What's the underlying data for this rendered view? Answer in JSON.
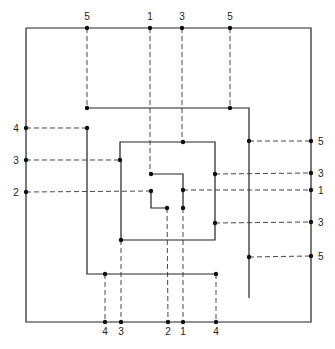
{
  "diagram": {
    "title": "",
    "colors": {
      "line": "#222222",
      "dashed": "#333333",
      "dot": "#111111",
      "background": "#ffffff"
    },
    "solid_paths": [
      {
        "name": "outer-boundary",
        "points": [
          [
            26,
            28
          ],
          [
            311,
            28
          ],
          [
            311,
            322
          ],
          [
            26,
            322
          ],
          [
            26,
            28
          ]
        ]
      },
      {
        "name": "spiral-level-2",
        "points": [
          [
            87,
            108
          ],
          [
            249,
            108
          ],
          [
            249,
            298
          ]
        ]
      },
      {
        "name": "spiral-level-2-left",
        "points": [
          [
            87,
            128
          ],
          [
            87,
            274
          ],
          [
            216,
            274
          ]
        ]
      },
      {
        "name": "spiral-level-3",
        "points": [
          [
            120,
            160
          ],
          [
            120,
            142
          ],
          [
            215,
            142
          ],
          [
            215,
            240
          ],
          [
            121,
            240
          ],
          [
            121,
            160
          ]
        ]
      },
      {
        "name": "spiral-inner-a",
        "points": [
          [
            151,
            174
          ],
          [
            183,
            174
          ],
          [
            183,
            208
          ]
        ]
      },
      {
        "name": "spiral-inner-b",
        "points": [
          [
            151,
            191
          ],
          [
            151,
            208
          ],
          [
            167,
            208
          ]
        ]
      }
    ],
    "dashed_lines": [
      {
        "from": [
          87,
          28
        ],
        "to": [
          87,
          108
        ]
      },
      {
        "from": [
          150,
          28
        ],
        "to": [
          150,
          174
        ]
      },
      {
        "from": [
          182,
          28
        ],
        "to": [
          182,
          142
        ]
      },
      {
        "from": [
          230,
          28
        ],
        "to": [
          230,
          108
        ]
      },
      {
        "from": [
          26,
          128
        ],
        "to": [
          87,
          128
        ]
      },
      {
        "from": [
          26,
          160
        ],
        "to": [
          120,
          160
        ]
      },
      {
        "from": [
          26,
          192
        ],
        "to": [
          151,
          191
        ]
      },
      {
        "from": [
          249,
          141
        ],
        "to": [
          311,
          141
        ]
      },
      {
        "from": [
          215,
          174
        ],
        "to": [
          311,
          173
        ]
      },
      {
        "from": [
          183,
          190
        ],
        "to": [
          311,
          190
        ]
      },
      {
        "from": [
          215,
          223
        ],
        "to": [
          311,
          222
        ]
      },
      {
        "from": [
          249,
          257
        ],
        "to": [
          311,
          256
        ]
      },
      {
        "from": [
          105,
          274
        ],
        "to": [
          105,
          322
        ]
      },
      {
        "from": [
          121,
          240
        ],
        "to": [
          121,
          322
        ]
      },
      {
        "from": [
          167,
          208
        ],
        "to": [
          168,
          322
        ]
      },
      {
        "from": [
          183,
          208
        ],
        "to": [
          183,
          322
        ]
      },
      {
        "from": [
          216,
          274
        ],
        "to": [
          216,
          322
        ]
      }
    ],
    "dots": [
      [
        87,
        28
      ],
      [
        150,
        28
      ],
      [
        182,
        28
      ],
      [
        230,
        28
      ],
      [
        87,
        108
      ],
      [
        230,
        108
      ],
      [
        26,
        128
      ],
      [
        26,
        160
      ],
      [
        26,
        192
      ],
      [
        87,
        128
      ],
      [
        120,
        160
      ],
      [
        311,
        141
      ],
      [
        311,
        173
      ],
      [
        311,
        190
      ],
      [
        311,
        222
      ],
      [
        311,
        256
      ],
      [
        249,
        141
      ],
      [
        215,
        174
      ],
      [
        183,
        190
      ],
      [
        215,
        223
      ],
      [
        249,
        257
      ],
      [
        183,
        142
      ],
      [
        151,
        174
      ],
      [
        151,
        191
      ],
      [
        167,
        208
      ],
      [
        183,
        208
      ],
      [
        121,
        240
      ],
      [
        105,
        274
      ],
      [
        216,
        274
      ],
      [
        105,
        322
      ],
      [
        121,
        322
      ],
      [
        168,
        322
      ],
      [
        183,
        322
      ],
      [
        216,
        322
      ]
    ],
    "labels_top": [
      {
        "text": "5",
        "x": 87,
        "y": 20
      },
      {
        "text": "1",
        "x": 150,
        "y": 20
      },
      {
        "text": "3",
        "x": 182,
        "y": 20
      },
      {
        "text": "5",
        "x": 230,
        "y": 20
      }
    ],
    "labels_left": [
      {
        "text": "4",
        "x": 16,
        "y": 132
      },
      {
        "text": "3",
        "x": 16,
        "y": 164
      },
      {
        "text": "2",
        "x": 16,
        "y": 196
      }
    ],
    "labels_right": [
      {
        "text": "5",
        "x": 318,
        "y": 145
      },
      {
        "text": "3",
        "x": 318,
        "y": 177
      },
      {
        "text": "1",
        "x": 318,
        "y": 194
      },
      {
        "text": "3",
        "x": 318,
        "y": 226
      },
      {
        "text": "5",
        "x": 318,
        "y": 260
      }
    ],
    "labels_bottom": [
      {
        "text": "4",
        "x": 105,
        "y": 335
      },
      {
        "text": "3",
        "x": 121,
        "y": 335
      },
      {
        "text": "2",
        "x": 168,
        "y": 335
      },
      {
        "text": "1",
        "x": 183,
        "y": 335
      },
      {
        "text": "4",
        "x": 216,
        "y": 335
      }
    ]
  }
}
